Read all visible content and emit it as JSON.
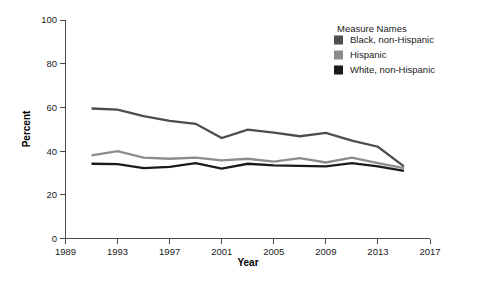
{
  "chart_data": {
    "type": "line",
    "title": "",
    "xlabel": "Year",
    "ylabel": "Percent",
    "xlim": [
      1989,
      2017
    ],
    "ylim": [
      0,
      100
    ],
    "xticks": [
      1989,
      1993,
      1997,
      2001,
      2005,
      2009,
      2013,
      2017
    ],
    "yticks": [
      0,
      20,
      40,
      60,
      80,
      100
    ],
    "grid": false,
    "legend_position": "top-right",
    "legend_title": "Measure Names",
    "x": [
      1991,
      1993,
      1995,
      1997,
      1999,
      2001,
      2003,
      2005,
      2007,
      2009,
      2011,
      2013,
      2015
    ],
    "series": [
      {
        "name": "Black, non-Hispanic",
        "color": "#4d4d4d",
        "values": [
          59.5,
          59.0,
          56.0,
          53.8,
          52.5,
          46.0,
          49.8,
          48.5,
          46.8,
          48.3,
          44.8,
          42.0,
          33.0
        ]
      },
      {
        "name": "Hispanic",
        "color": "#8c8c8c",
        "values": [
          38.0,
          40.0,
          37.0,
          36.5,
          37.0,
          35.8,
          36.5,
          35.2,
          36.8,
          34.8,
          37.0,
          34.5,
          32.2
        ]
      },
      {
        "name": "White, non-Hispanic",
        "color": "#1a1a1a",
        "values": [
          34.2,
          34.0,
          32.2,
          32.8,
          34.5,
          32.0,
          34.2,
          33.5,
          33.2,
          33.0,
          34.5,
          33.0,
          31.0
        ]
      }
    ]
  },
  "legend": {
    "title": "Measure Names",
    "entries": [
      {
        "label": "Black, non-Hispanic",
        "swatch_color": "#4d4d4d",
        "swatch_name": "legend-swatch-black-non-hispanic"
      },
      {
        "label": "Hispanic",
        "swatch_color": "#8c8c8c",
        "swatch_name": "legend-swatch-hispanic"
      },
      {
        "label": "White, non-Hispanic",
        "swatch_color": "#1a1a1a",
        "swatch_name": "legend-swatch-white-non-hispanic"
      }
    ]
  },
  "axes": {
    "y_title": "Percent",
    "x_title": "Year",
    "y_tick_labels": [
      "0",
      "20",
      "40",
      "60",
      "80",
      "100"
    ],
    "x_tick_labels": [
      "1989",
      "1993",
      "1997",
      "2001",
      "2005",
      "2009",
      "2013",
      "2017"
    ]
  },
  "colors": {
    "axis": "#4a4a4a",
    "text": "#1a1a1a",
    "background": "#ffffff"
  }
}
